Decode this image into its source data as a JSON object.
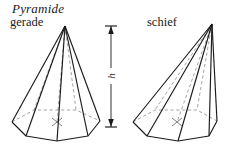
{
  "figure": {
    "title": "Pyramide",
    "labels": {
      "left_pyramid": "gerade",
      "right_pyramid": "schief",
      "height": "h"
    },
    "colors": {
      "stroke": "#1a1a1a",
      "hidden_stroke": "#9a9a9a",
      "background": "#ffffff"
    },
    "geometry": {
      "left_pyramid": {
        "kind": "right-hexagonal-pyramid",
        "apex": [
          65,
          26
        ],
        "base_front": [
          [
            12,
            122
          ],
          [
            26,
            136
          ],
          [
            57,
            141
          ],
          [
            88,
            136
          ],
          [
            100,
            121
          ]
        ],
        "base_back": [
          [
            12,
            122
          ],
          [
            34,
            110
          ],
          [
            76,
            110
          ],
          [
            100,
            121
          ]
        ],
        "center": [
          57,
          122
        ],
        "height_axis": [
          [
            65,
            26
          ],
          [
            57,
            122
          ]
        ]
      },
      "right_pyramid": {
        "kind": "oblique-hexagonal-pyramid",
        "apex": [
          212,
          24
        ],
        "base_front": [
          [
            133,
            122
          ],
          [
            147,
            136
          ],
          [
            178,
            141
          ],
          [
            209,
            136
          ],
          [
            217,
            121
          ]
        ],
        "base_back": [
          [
            133,
            122
          ],
          [
            155,
            110
          ],
          [
            197,
            110
          ],
          [
            217,
            121
          ]
        ],
        "center": [
          177,
          122
        ],
        "height_axis": [
          [
            212,
            24
          ],
          [
            177,
            122
          ]
        ]
      },
      "height_indicator": {
        "x": 111,
        "top_y": 26,
        "bottom_y": 127,
        "tick_half_width": 6
      }
    }
  }
}
